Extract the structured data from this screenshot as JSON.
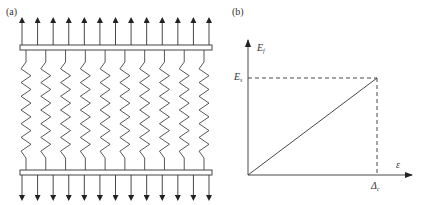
{
  "panel_a": {
    "label": "(a)",
    "description": "Parallel springs between two rigid plates under uniform tension",
    "arrow_count_top": 13,
    "arrow_count_bottom": 13,
    "spring_count": 10
  },
  "panel_b": {
    "label": "(b)",
    "y_axis_label": "E",
    "y_axis_sub": "f",
    "y_tick_label": "E",
    "y_tick_sub": "s",
    "x_axis_label": "ε",
    "x_tick_label": "Δ",
    "x_tick_sub": "c"
  },
  "chart_data": {
    "type": "line",
    "title": "",
    "xlabel": "ε",
    "ylabel": "E_f",
    "series": [
      {
        "name": "linear response",
        "x": [
          0,
          1
        ],
        "y": [
          0,
          1
        ]
      }
    ],
    "annotations": [
      {
        "type": "dashed-hline",
        "y": 1,
        "label": "E_s"
      },
      {
        "type": "dashed-vline",
        "x": 1,
        "label": "Δ_c"
      }
    ],
    "grid": false,
    "legend": null,
    "xlim": [
      0,
      1.4
    ],
    "ylim": [
      0,
      1.4
    ]
  },
  "colors": {
    "stroke": "#333333",
    "background": "#ffffff"
  }
}
